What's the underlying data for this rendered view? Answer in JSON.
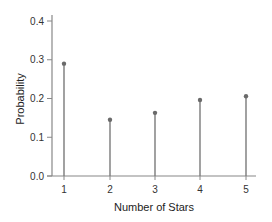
{
  "chart_data": {
    "type": "stem",
    "title": "",
    "xlabel": "Number of Stars",
    "ylabel": "Probability",
    "categories": [
      "1",
      "2",
      "3",
      "4",
      "5"
    ],
    "x": [
      1,
      2,
      3,
      4,
      5
    ],
    "values": [
      0.29,
      0.145,
      0.163,
      0.196,
      0.206
    ],
    "ylim": [
      0.0,
      0.4
    ],
    "yticks": [
      "0.0",
      "0.1",
      "0.2",
      "0.3",
      "0.4"
    ],
    "xticks": [
      "1",
      "2",
      "3",
      "4",
      "5"
    ],
    "grid": false,
    "legend": null,
    "colors": {
      "stem": "#7a7a7a",
      "marker": "#6a6a6a",
      "axis": "#888888"
    }
  }
}
